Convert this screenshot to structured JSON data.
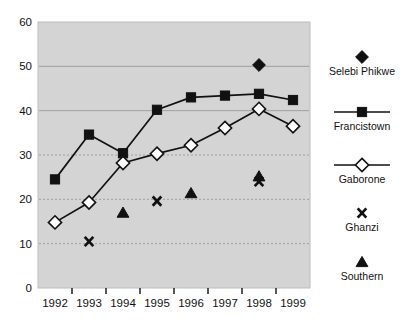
{
  "chart_data": {
    "type": "line",
    "title": "",
    "xlabel": "",
    "ylabel": "",
    "categories": [
      "1992",
      "1993",
      "1994",
      "1995",
      "1996",
      "1997",
      "1998",
      "1999"
    ],
    "ylim": [
      0,
      60
    ],
    "yticks": [
      0,
      10,
      20,
      30,
      40,
      50,
      60
    ],
    "grid": true,
    "gridlines_at": [
      10,
      20,
      30,
      40,
      50
    ],
    "legend_position": "right",
    "plot_background": "#d4d4d4",
    "series": [
      {
        "name": "Selebi Phikwe",
        "marker": "filled-diamond",
        "line": false,
        "color": "#111111",
        "points": [
          {
            "x": "1998",
            "y": 50.3
          }
        ],
        "values": [
          null,
          null,
          null,
          null,
          null,
          null,
          50.3,
          null
        ]
      },
      {
        "name": "Francistown",
        "marker": "filled-square",
        "line": true,
        "color": "#111111",
        "points": [
          {
            "x": "1992",
            "y": 24.5
          },
          {
            "x": "1993",
            "y": 34.6
          },
          {
            "x": "1994",
            "y": 30.4
          },
          {
            "x": "1995",
            "y": 40.2
          },
          {
            "x": "1996",
            "y": 43.0
          },
          {
            "x": "1997",
            "y": 43.4
          },
          {
            "x": "1998",
            "y": 43.8
          },
          {
            "x": "1999",
            "y": 42.4
          }
        ],
        "values": [
          24.5,
          34.6,
          30.4,
          40.2,
          43.0,
          43.4,
          43.8,
          42.4
        ]
      },
      {
        "name": "Gaborone",
        "marker": "open-diamond",
        "line": true,
        "color": "#111111",
        "points": [
          {
            "x": "1992",
            "y": 14.8
          },
          {
            "x": "1993",
            "y": 19.3
          },
          {
            "x": "1994",
            "y": 28.2
          },
          {
            "x": "1995",
            "y": 30.3
          },
          {
            "x": "1996",
            "y": 32.2
          },
          {
            "x": "1997",
            "y": 36.1
          },
          {
            "x": "1998",
            "y": 40.4
          },
          {
            "x": "1999",
            "y": 36.5
          }
        ],
        "values": [
          14.8,
          19.3,
          28.2,
          30.3,
          32.2,
          36.1,
          40.4,
          36.5
        ]
      },
      {
        "name": "Ghanzi",
        "marker": "cross-x",
        "line": false,
        "color": "#111111",
        "points": [
          {
            "x": "1993",
            "y": 10.5
          },
          {
            "x": "1995",
            "y": 19.6
          },
          {
            "x": "1998",
            "y": 24.0
          }
        ],
        "values": [
          null,
          10.5,
          null,
          19.6,
          null,
          null,
          24.0,
          null
        ]
      },
      {
        "name": "Southern",
        "marker": "filled-triangle",
        "line": false,
        "color": "#111111",
        "points": [
          {
            "x": "1994",
            "y": 17.0
          },
          {
            "x": "1996",
            "y": 21.4
          },
          {
            "x": "1998",
            "y": 25.2
          }
        ],
        "values": [
          null,
          null,
          17.0,
          null,
          21.4,
          null,
          25.2,
          null
        ]
      }
    ]
  },
  "legend": {
    "entries": [
      {
        "label": "Selebi  Phikwe",
        "marker": "filled-diamond",
        "has_line": false
      },
      {
        "label": "Francistown",
        "marker": "filled-square",
        "has_line": true
      },
      {
        "label": "Gaborone",
        "marker": "open-diamond",
        "has_line": true
      },
      {
        "label": "Ghanzi",
        "marker": "cross-x",
        "has_line": false
      },
      {
        "label": "Southern",
        "marker": "filled-triangle",
        "has_line": false
      }
    ]
  },
  "axes": {
    "y_tick_labels": [
      "60",
      "50",
      "40",
      "30",
      "20",
      "10",
      "0"
    ],
    "x_tick_labels": [
      "1992",
      "1993",
      "1994",
      "1995",
      "1996",
      "1997",
      "1998",
      "1999"
    ]
  },
  "colors": {
    "plot_bg": "#d4d4d4",
    "marker": "#111111",
    "line": "#111111",
    "gridline": "#9a9a9a",
    "text": "#111111"
  }
}
